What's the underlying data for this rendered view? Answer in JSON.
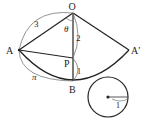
{
  "figure": {
    "points": {
      "O": "O",
      "A": "A",
      "A_prime": "A′",
      "P": "P",
      "B": "B"
    },
    "labels": {
      "OA_length": "3",
      "OP_length": "2",
      "PB_length": "1",
      "arc_AB_length": "π",
      "angle": "θ",
      "circle_radius": "1"
    },
    "colors": {
      "stroke": "#222222",
      "annotation": "#666666"
    }
  }
}
